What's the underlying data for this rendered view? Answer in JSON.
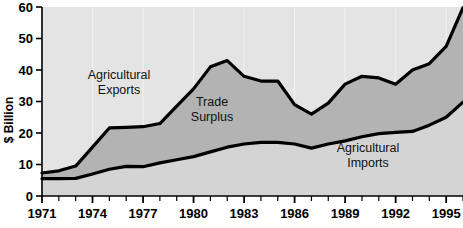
{
  "chart_data": {
    "type": "area",
    "title": "",
    "subtitle": "",
    "xlabel": "",
    "ylabel": "$ Billion",
    "xlim": [
      1971,
      1996
    ],
    "ylim": [
      0,
      60
    ],
    "grid": "faint-vertical",
    "legend_position": "inline-annotations",
    "y_ticks": [
      0,
      10,
      20,
      30,
      40,
      50,
      60
    ],
    "y_tick_labels": [
      "0",
      "10",
      "20",
      "30",
      "40",
      "50",
      "60"
    ],
    "x_ticks": [
      1971,
      1972,
      1973,
      1974,
      1975,
      1976,
      1977,
      1978,
      1979,
      1980,
      1981,
      1982,
      1983,
      1984,
      1985,
      1986,
      1987,
      1988,
      1989,
      1990,
      1991,
      1992,
      1993,
      1994,
      1995,
      1996
    ],
    "x_tick_labels": [
      "1971",
      "",
      "",
      "1974",
      "",
      "",
      "1977",
      "",
      "",
      "1980",
      "",
      "",
      "1983",
      "",
      "",
      "1986",
      "",
      "",
      "1989",
      "",
      "",
      "1992",
      "",
      "",
      "1995",
      ""
    ],
    "x": [
      1971,
      1972,
      1973,
      1974,
      1975,
      1976,
      1977,
      1978,
      1979,
      1980,
      1981,
      1982,
      1983,
      1984,
      1985,
      1986,
      1987,
      1988,
      1989,
      1990,
      1991,
      1992,
      1993,
      1994,
      1995,
      1996
    ],
    "series": [
      {
        "name": "Agricultural Exports",
        "values": [
          7.3,
          8.0,
          9.5,
          15.5,
          21.6,
          21.8,
          22.0,
          23.0,
          28.5,
          34.0,
          41.0,
          43.0,
          38.0,
          36.5,
          36.5,
          29.0,
          26.0,
          29.5,
          35.5,
          38.0,
          37.5,
          35.5,
          40.0,
          42.0,
          47.5,
          59.8
        ],
        "color": "#000000",
        "fill": "#b3b3b3"
      },
      {
        "name": "Agricultural Imports",
        "values": [
          5.5,
          5.5,
          5.6,
          7.0,
          8.5,
          9.4,
          9.3,
          10.5,
          11.5,
          12.5,
          14.0,
          15.5,
          16.5,
          17.0,
          17.0,
          16.5,
          15.2,
          16.5,
          17.5,
          18.8,
          19.8,
          20.2,
          20.5,
          22.5,
          25.0,
          29.8
        ],
        "color": "#000000",
        "fill": "#d9d9d9"
      }
    ],
    "annotations": [
      {
        "text_line1": "Agricultural",
        "text_line2": "Exports",
        "x_px": 119,
        "y_px": 79
      },
      {
        "text_line1": "Trade",
        "text_line2": "Surplus",
        "x_px": 212,
        "y_px": 106
      },
      {
        "text_line1": "Agricultural",
        "text_line2": "Imports",
        "x_px": 368,
        "y_px": 152
      }
    ],
    "colors": {
      "plot_background": "#e4e4e4",
      "surplus_fill": "#b3b3b3",
      "imports_fill": "#d4d4d4",
      "line": "#000000",
      "axis": "#000000",
      "gridline": "#f0f0f0"
    }
  }
}
